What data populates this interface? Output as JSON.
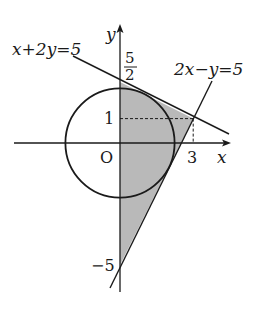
{
  "diagram": {
    "type": "coordinate-geometry",
    "axes": {
      "x_label": "x",
      "y_label": "y",
      "origin_label": "O"
    },
    "circle": {
      "equation": "x^2+y^2=5",
      "center": [
        0,
        0
      ],
      "radius_squared": 5
    },
    "lines": [
      {
        "label": "x+2y=5",
        "points": [
          [
            0,
            2.5
          ],
          [
            3,
            1
          ]
        ]
      },
      {
        "label": "2x−y=5",
        "points": [
          [
            3,
            1
          ],
          [
            0,
            -5
          ]
        ]
      }
    ],
    "shaded_region": {
      "vertices": [
        [
          0,
          2.5
        ],
        [
          3,
          1
        ],
        [
          0,
          -5
        ]
      ],
      "fill": "#b9b9b9"
    },
    "tick_labels": {
      "y_top_numerator": "5",
      "y_top_denominator": "2",
      "y_one": "1",
      "x_three": "3",
      "y_neg_five": "−5"
    },
    "guide_point": [
      3,
      1
    ],
    "colors": {
      "stroke": "#1a1a1a",
      "shade": "#b9b9b9",
      "background": "#ffffff"
    }
  }
}
